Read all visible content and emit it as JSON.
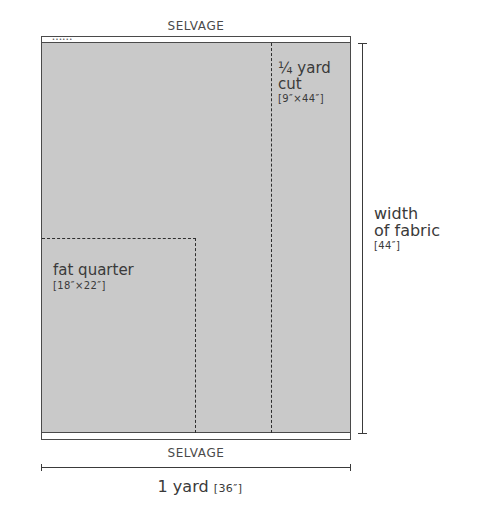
{
  "diagram": {
    "selvage_top": "SELVAGE",
    "selvage_bottom": "SELVAGE",
    "selvage_marks": "••••••",
    "quarter_yard": {
      "line1": "¼ yard",
      "line2": "cut",
      "dims": "[9″×44″]"
    },
    "fat_quarter": {
      "label": "fat quarter",
      "dims": "[18″×22″]"
    },
    "width_dimension": {
      "line1": "width",
      "line2": "of fabric",
      "dims": "[44″]"
    },
    "length_dimension": {
      "label": "1 yard",
      "dims": "[36″]"
    },
    "colors": {
      "fabric_fill": "#c9c9c9",
      "outline": "#4a4a4a",
      "dash": "#2e2e2e",
      "text": "#3a3a3a"
    }
  }
}
